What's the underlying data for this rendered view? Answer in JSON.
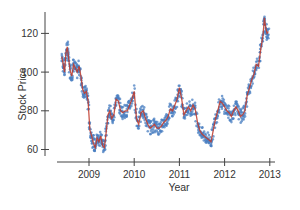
{
  "chart_data": {
    "type": "line",
    "title": "",
    "xlabel": "Year",
    "ylabel": "Stock Price",
    "xlim": [
      2008.38,
      2013.0
    ],
    "ylim": [
      57,
      130
    ],
    "x_ticks": [
      2009,
      2010,
      2011,
      2012,
      2013
    ],
    "x_tick_labels": [
      "2009",
      "2010",
      "2011",
      "2012",
      "2013"
    ],
    "y_ticks": [
      60,
      80,
      100,
      120
    ],
    "y_tick_labels": [
      "60",
      "80",
      "100",
      "120"
    ],
    "grid": false,
    "legend": null,
    "series": [
      {
        "name": "Stock Price (daily points)",
        "style": "markers",
        "color": "#4a7fc1",
        "x": [
          2008.4,
          2008.43,
          2008.46,
          2008.49,
          2008.52,
          2008.55,
          2008.58,
          2008.62,
          2008.66,
          2008.7,
          2008.74,
          2008.78,
          2008.82,
          2008.86,
          2008.9,
          2008.94,
          2008.98,
          2009.02,
          2009.06,
          2009.1,
          2009.14,
          2009.18,
          2009.22,
          2009.26,
          2009.3,
          2009.34,
          2009.38,
          2009.42,
          2009.46,
          2009.5,
          2009.55,
          2009.6,
          2009.65,
          2009.7,
          2009.75,
          2009.8,
          2009.85,
          2009.9,
          2009.95,
          2010.0,
          2010.05,
          2010.1,
          2010.15,
          2010.2,
          2010.25,
          2010.3,
          2010.35,
          2010.4,
          2010.45,
          2010.5,
          2010.55,
          2010.6,
          2010.65,
          2010.7,
          2010.75,
          2010.8,
          2010.85,
          2010.9,
          2010.95,
          2011.0,
          2011.05,
          2011.1,
          2011.15,
          2011.2,
          2011.25,
          2011.3,
          2011.35,
          2011.4,
          2011.45,
          2011.5,
          2011.55,
          2011.6,
          2011.65,
          2011.7,
          2011.75,
          2011.8,
          2011.85,
          2011.9,
          2011.95,
          2012.0,
          2012.05,
          2012.1,
          2012.15,
          2012.2,
          2012.25,
          2012.3,
          2012.35,
          2012.4,
          2012.45,
          2012.5,
          2012.55,
          2012.6,
          2012.65,
          2012.7,
          2012.75,
          2012.8,
          2012.85,
          2012.88,
          2012.91,
          2012.94,
          2012.97
        ],
        "values": [
          108,
          104,
          100,
          110,
          113,
          107,
          101,
          98,
          104,
          102,
          100,
          103,
          98,
          91,
          89,
          90,
          85,
          70,
          67,
          63,
          61,
          66,
          64,
          67,
          62,
          61,
          69,
          78,
          80,
          76,
          78,
          86,
          85,
          80,
          79,
          80,
          80,
          83,
          86,
          90,
          76,
          73,
          79,
          80,
          76,
          73,
          71,
          72,
          73,
          71,
          71,
          72,
          74,
          75,
          77,
          81,
          80,
          83,
          86,
          92,
          86,
          78,
          80,
          82,
          80,
          83,
          81,
          74,
          70,
          68,
          67,
          66,
          65,
          64,
          70,
          76,
          80,
          85,
          84,
          82,
          80,
          79,
          77,
          80,
          82,
          80,
          77,
          78,
          80,
          88,
          92,
          96,
          99,
          104,
          103,
          112,
          119,
          128,
          123,
          120,
          121
        ]
      },
      {
        "name": "Smoothed trend",
        "style": "line",
        "color": "#c0392b"
      }
    ]
  },
  "axes": {
    "xlabel": "Year",
    "ylabel": "Stock Price"
  }
}
